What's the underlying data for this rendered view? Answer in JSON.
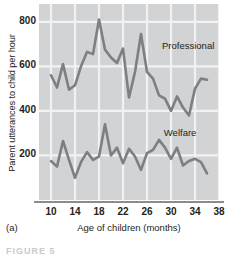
{
  "panel_letter": "(a)",
  "caption_sliver": "FIGURE 5",
  "chart_data": {
    "type": "line",
    "title": "",
    "xlabel": "Age of children (months)",
    "ylabel": "Parent utterances to child per hour",
    "xlim": [
      8,
      38
    ],
    "ylim": [
      0,
      880
    ],
    "xticks": [
      10,
      14,
      18,
      22,
      26,
      30,
      34,
      38
    ],
    "yticks": [
      200,
      400,
      600,
      800
    ],
    "grid": true,
    "legend_position": "inline-annotation",
    "plot_background": "#d2d3d5",
    "gridline_color": "#f2f2f2",
    "line_color": "#7d7f82",
    "axis_color": "#8a8c8e",
    "text_color": "#231f20",
    "series": [
      {
        "name": "Professional",
        "label_x": 28.5,
        "label_y": 690,
        "x": [
          10,
          11,
          12,
          13,
          14,
          15,
          16,
          17,
          18,
          19,
          20,
          21,
          22,
          23,
          24,
          25,
          26,
          27,
          28,
          29,
          30,
          31,
          32,
          33,
          34,
          35,
          36
        ],
        "values": [
          560,
          505,
          610,
          495,
          515,
          600,
          665,
          655,
          810,
          675,
          640,
          615,
          680,
          460,
          575,
          745,
          575,
          545,
          470,
          455,
          400,
          465,
          415,
          380,
          500,
          545,
          540
        ]
      },
      {
        "name": "Welfare",
        "label_x": 28.8,
        "label_y": 300,
        "x": [
          10,
          11,
          12,
          13,
          14,
          15,
          16,
          17,
          18,
          19,
          20,
          21,
          22,
          23,
          24,
          25,
          26,
          27,
          28,
          29,
          30,
          31,
          32,
          33,
          34,
          35,
          36
        ],
        "values": [
          175,
          150,
          265,
          180,
          100,
          170,
          215,
          180,
          195,
          340,
          200,
          235,
          165,
          230,
          195,
          135,
          210,
          225,
          270,
          235,
          185,
          235,
          155,
          175,
          185,
          170,
          120
        ]
      }
    ]
  }
}
